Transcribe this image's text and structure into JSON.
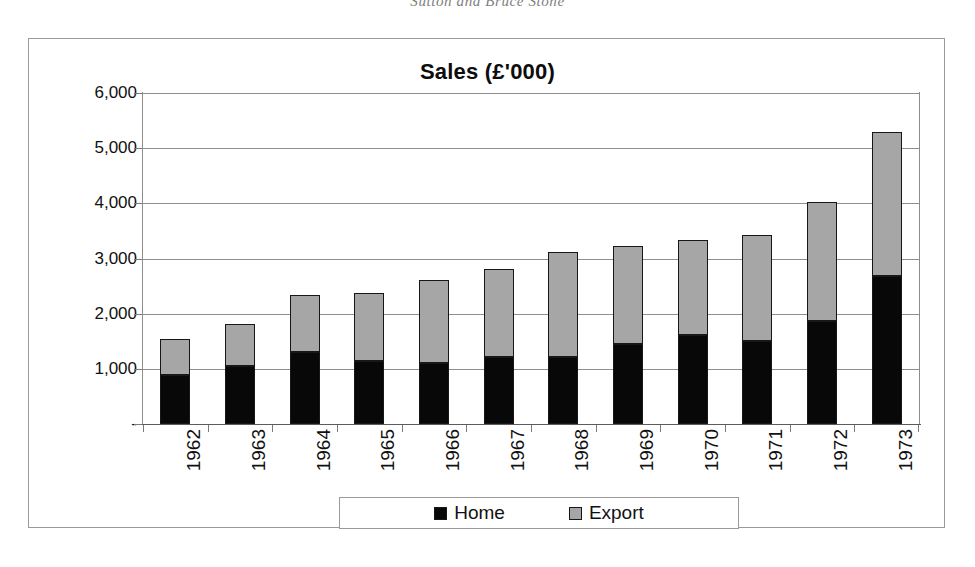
{
  "page_header": "Sutton and Bruce Stone",
  "chart": {
    "title": "Sales (£'000)",
    "legend": {
      "home_label": "Home",
      "export_label": "Export",
      "home_color": "#080808",
      "export_color": "#a6a6a6"
    }
  },
  "chart_data": {
    "type": "bar",
    "stacked": true,
    "title": "Sales (£'000)",
    "subtitle": "",
    "xlabel": "",
    "ylabel": "",
    "ylim": [
      0,
      6000
    ],
    "ytick_labels": [
      "6,000",
      "5,000",
      "4,000",
      "3,000",
      "2,000",
      "1,000",
      "-"
    ],
    "ytick_values": [
      6000,
      5000,
      4000,
      3000,
      2000,
      1000,
      0
    ],
    "grid": true,
    "legend_position": "bottom",
    "categories": [
      "1962",
      "1963",
      "1964",
      "1965",
      "1966",
      "1967",
      "1968",
      "1969",
      "1970",
      "1971",
      "1972",
      "1973"
    ],
    "series": [
      {
        "name": "Home",
        "color": "#080808",
        "values": [
          880,
          1050,
          1300,
          1140,
          1110,
          1215,
          1210,
          1450,
          1610,
          1500,
          1870,
          2680
        ]
      },
      {
        "name": "Export",
        "color": "#a6a6a6",
        "values": [
          660,
          760,
          1030,
          1240,
          1500,
          1600,
          1910,
          1780,
          1725,
          1925,
          2155,
          2610
        ]
      }
    ],
    "totals": [
      1540,
      1810,
      2330,
      2380,
      2610,
      2815,
      3120,
      3230,
      3335,
      3425,
      4025,
      5290
    ]
  }
}
